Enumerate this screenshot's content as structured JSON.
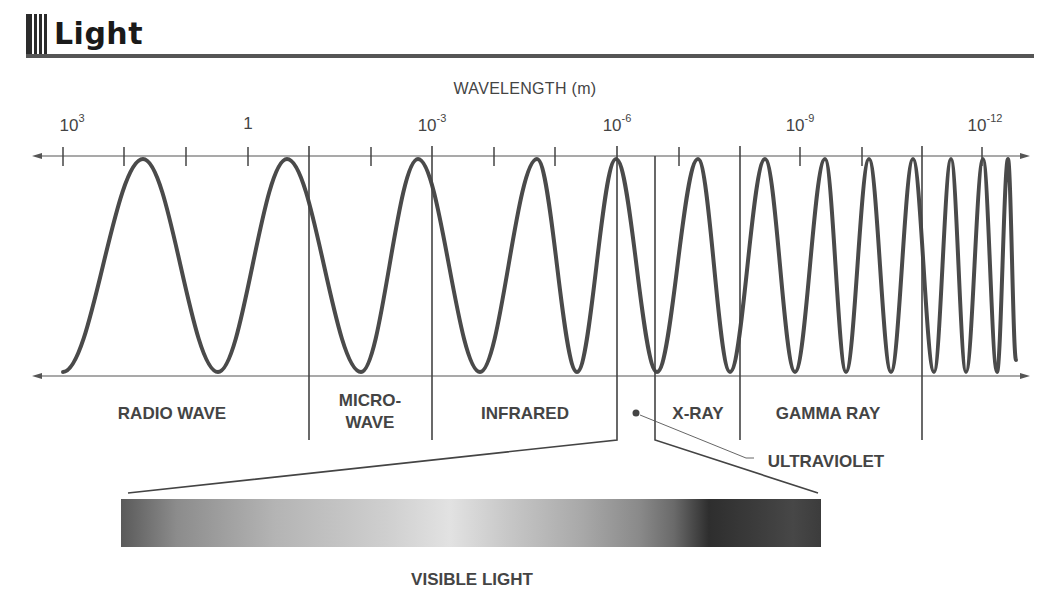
{
  "header": {
    "title": "Light"
  },
  "diagram": {
    "axis_title": "WAVELENGTH (m)",
    "tick_labels": [
      {
        "base": "10",
        "exp": "3",
        "x": 72
      },
      {
        "base": "1",
        "exp": "",
        "x": 248
      },
      {
        "base": "10",
        "exp": "-3",
        "x": 432
      },
      {
        "base": "10",
        "exp": "-6",
        "x": 617
      },
      {
        "base": "10",
        "exp": "-9",
        "x": 800
      },
      {
        "base": "10",
        "exp": "-12",
        "x": 985
      }
    ],
    "bands": [
      {
        "id": "radio",
        "label": "RADIO WAVE",
        "x": 172,
        "y": 403
      },
      {
        "id": "microwave",
        "label_line1": "MICRO-",
        "label_line2": "WAVE",
        "x": 370,
        "y": 390
      },
      {
        "id": "infrared",
        "label": "INFRARED",
        "x": 525,
        "y": 403
      },
      {
        "id": "xray",
        "label": "X-RAY",
        "x": 698,
        "y": 403
      },
      {
        "id": "gamma",
        "label": "GAMMA RAY",
        "x": 828,
        "y": 403
      }
    ],
    "callout": {
      "label": "ULTRAVIOLET"
    },
    "visible": {
      "label": "VISIBLE LIGHT"
    }
  },
  "colors": {
    "wave": "#4a4a4a",
    "axis": "#555555",
    "text": "#444444",
    "header_rule": "#555555"
  }
}
